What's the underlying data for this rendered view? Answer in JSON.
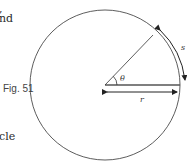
{
  "text_fragments": {
    "top_line_1": ",",
    "top_line_2": "nd",
    "bottom_line": "cle"
  },
  "figure": {
    "label": "Fig. 51",
    "symbols": {
      "angle": "θ",
      "arc_length": "s",
      "radius": "r"
    },
    "colors": {
      "stroke": "#333333",
      "radius_line": "#555555"
    }
  }
}
